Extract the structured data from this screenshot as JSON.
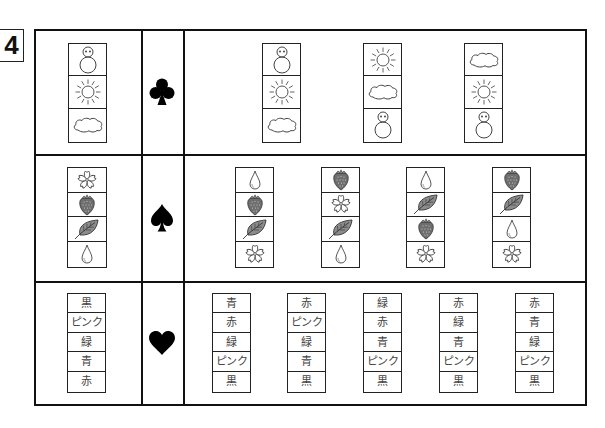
{
  "question_number": "4",
  "rows": [
    {
      "suit": "club",
      "suit_symbol": "♣",
      "example": [
        "snowman",
        "sun",
        "cloud"
      ],
      "options": [
        [
          "snowman",
          "sun",
          "cloud"
        ],
        [
          "sun",
          "cloud",
          "snowman"
        ],
        [
          "cloud",
          "sun",
          "snowman"
        ]
      ]
    },
    {
      "suit": "spade",
      "suit_symbol": "♠",
      "example": [
        "cherry-blossom",
        "strawberry",
        "leaf",
        "water-drop"
      ],
      "options": [
        [
          "water-drop",
          "strawberry",
          "leaf",
          "cherry-blossom"
        ],
        [
          "strawberry",
          "cherry-blossom",
          "leaf",
          "water-drop"
        ],
        [
          "water-drop",
          "leaf",
          "strawberry",
          "cherry-blossom"
        ],
        [
          "strawberry",
          "leaf",
          "water-drop",
          "cherry-blossom"
        ]
      ]
    },
    {
      "suit": "heart",
      "suit_symbol": "♥",
      "example": [
        "黒",
        "ピンク",
        "緑",
        "青",
        "赤"
      ],
      "options": [
        [
          "青",
          "赤",
          "緑",
          "ピンク",
          "黒"
        ],
        [
          "赤",
          "ピンク",
          "緑",
          "青",
          "黒"
        ],
        [
          "緑",
          "赤",
          "青",
          "ピンク",
          "黒"
        ],
        [
          "赤",
          "緑",
          "青",
          "ピンク",
          "黒"
        ],
        [
          "赤",
          "青",
          "緑",
          "ピンク",
          "黒"
        ]
      ]
    }
  ]
}
